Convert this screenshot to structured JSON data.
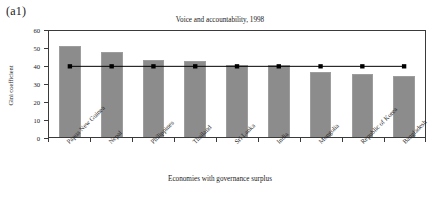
{
  "panel": {
    "label": "(a1)"
  },
  "chart_data": {
    "type": "bar",
    "title": "Voice and accountability, 1998",
    "xlabel": "Economies with governance surplus",
    "ylabel": "Gini coefficient",
    "ylim": [
      0,
      60
    ],
    "yticks": [
      0,
      10,
      20,
      30,
      40,
      50,
      60
    ],
    "grid": false,
    "legend": "none",
    "categories": [
      "Papua New Guinea",
      "Nepal",
      "Philippines",
      "Thailand",
      "Sri Lanka",
      "India",
      "Mongolia",
      "Republic of Korea",
      "Bangladesh"
    ],
    "series": [
      {
        "name": "Gini coefficient",
        "type": "bar",
        "color": "#8c8c8c",
        "values": [
          50.5,
          47.0,
          43.0,
          42.0,
          40.0,
          40.0,
          36.0,
          35.0,
          34.0
        ]
      },
      {
        "name": "Reference line",
        "type": "line",
        "color": "#000000",
        "marker": "square",
        "values": [
          40,
          40,
          40,
          40,
          40,
          40,
          40,
          40,
          40
        ]
      }
    ]
  }
}
